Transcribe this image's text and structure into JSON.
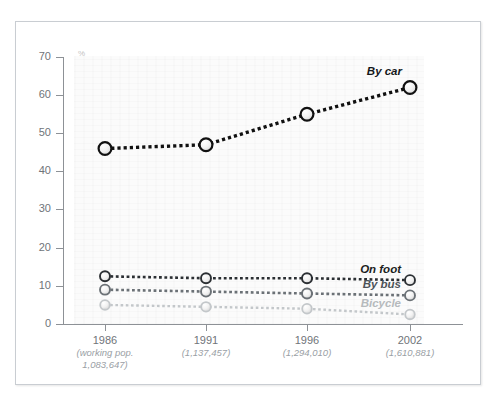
{
  "chart_data": {
    "type": "line",
    "title": "",
    "subtitle": "",
    "xlabel": "",
    "ylabel": "%",
    "ylim": [
      0,
      70
    ],
    "yticks": [
      0,
      10,
      20,
      30,
      40,
      50,
      60,
      70
    ],
    "grid": false,
    "legend_position": "end-of-line labels",
    "categories": [
      "1986",
      "1991",
      "1996",
      "2002"
    ],
    "category_sublabels": [
      "(working pop. 1,083,647)",
      "(1,137,457)",
      "(1,294,010)",
      "(1,610,881)"
    ],
    "series": [
      {
        "name": "By car",
        "values": [
          46,
          47,
          55,
          62
        ],
        "color": "#111111"
      },
      {
        "name": "On foot",
        "values": [
          12.5,
          12,
          12,
          11.5
        ],
        "color": "#2b2f33"
      },
      {
        "name": "By bus",
        "values": [
          9,
          8.5,
          8,
          7.5
        ],
        "color": "#6b7176"
      },
      {
        "name": "Bicycle",
        "values": [
          5,
          4.5,
          4,
          2.5
        ],
        "color": "#c3c7ca"
      }
    ]
  },
  "axes": {
    "y_unit_label": "%",
    "y_tick_labels": [
      "70",
      "60",
      "50",
      "40",
      "30",
      "20",
      "10",
      "0"
    ],
    "x_ticks": [
      {
        "year": "1986",
        "sub_line1": "(working pop.",
        "sub_line2": "1,083,647)"
      },
      {
        "year": "1991",
        "sub_line1": "(1,137,457)",
        "sub_line2": ""
      },
      {
        "year": "1996",
        "sub_line1": "(1,294,010)",
        "sub_line2": ""
      },
      {
        "year": "2002",
        "sub_line1": "(1,610,881)",
        "sub_line2": ""
      }
    ]
  },
  "series_labels": {
    "by_car": "By car",
    "on_foot": "On foot",
    "by_bus": "By bus",
    "bicycle": "Bicycle"
  },
  "colors": {
    "by_car": "#111111",
    "on_foot": "#2b2f33",
    "by_bus": "#6b7176",
    "bicycle": "#c3c7ca",
    "axis": "#8d9196",
    "tick_text": "#6f7479",
    "sub_text": "#9aa0a5",
    "frame": "#c9cdd2",
    "plot_bg": "#fbfbfb"
  }
}
